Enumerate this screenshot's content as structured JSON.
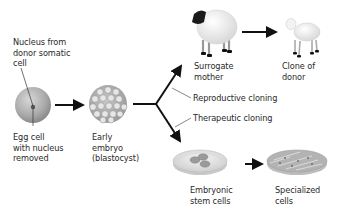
{
  "diagram": {
    "type": "flow",
    "labels": {
      "nucleus_from_donor": "Nucleus from\ndonor somatic\ncell",
      "egg_cell": "Egg cell\nwith nucleus\nremoved",
      "early_embryo": "Early\nembryo\n(blastocyst)",
      "surrogate_mother": "Surrogate\nmother",
      "clone_of_donor": "Clone of\ndonor",
      "reproductive_cloning": "Reproductive cloning",
      "therapeutic_cloning": "Therapeutic cloning",
      "embryonic_stem_cells": "Embryonic\nstem cells",
      "specialized_cells": "Specialized\ncells"
    },
    "nodes": [
      {
        "id": "egg",
        "label": "Egg cell with nucleus removed"
      },
      {
        "id": "embryo",
        "label": "Early embryo (blastocyst)"
      },
      {
        "id": "surrogate",
        "label": "Surrogate mother"
      },
      {
        "id": "clone",
        "label": "Clone of donor"
      },
      {
        "id": "stem",
        "label": "Embryonic stem cells"
      },
      {
        "id": "specialized",
        "label": "Specialized cells"
      }
    ],
    "edges": [
      {
        "from": "egg",
        "to": "embryo"
      },
      {
        "from": "embryo",
        "to": "surrogate",
        "label": "Reproductive cloning"
      },
      {
        "from": "surrogate",
        "to": "clone"
      },
      {
        "from": "embryo",
        "to": "stem",
        "label": "Therapeutic cloning"
      },
      {
        "from": "stem",
        "to": "specialized"
      }
    ]
  }
}
